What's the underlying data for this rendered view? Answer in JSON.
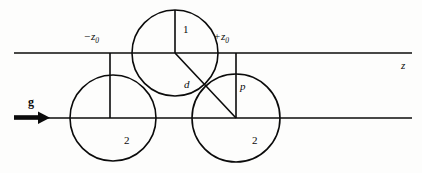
{
  "figure": {
    "background_color": "#fdfdfc",
    "ink_color": "#0b0b0b",
    "width": 422,
    "height": 173,
    "labels": {
      "left_bound_sign": "−",
      "left_bound_var": "z",
      "left_bound_sub": "0",
      "right_bound_sign": "+",
      "right_bound_var": "z",
      "right_bound_sub": "0",
      "axis": "z",
      "gravity": "g",
      "sphere_top": "1",
      "sphere_bottom_left": "2",
      "sphere_bottom_right": "2",
      "distance": "d",
      "point": "p"
    },
    "geometry": {
      "top_line": {
        "x1": 14,
        "y1": 53,
        "x2": 412,
        "y2": 53
      },
      "bottom_line": {
        "x1": 14,
        "y1": 118,
        "x2": 412,
        "y2": 118
      },
      "gravity_arrow": {
        "x1": 14,
        "y1": 118,
        "x2": 48,
        "y2": 118
      },
      "circle_top": {
        "cx": 175,
        "cy": 53,
        "r": 43
      },
      "circle_bottom_left": {
        "cx": 113,
        "cy": 118,
        "r": 43
      },
      "circle_bottom_right": {
        "cx": 236,
        "cy": 118,
        "r": 44
      },
      "vertical_radius_top": {
        "x1": 175,
        "y1": 10,
        "x2": 175,
        "y2": 53
      },
      "vertical_left_tick": {
        "x1": 110,
        "y1": 53,
        "x2": 110,
        "y2": 118
      },
      "vertical_right_tick": {
        "x1": 236,
        "y1": 53,
        "x2": 236,
        "y2": 118
      },
      "diagonal_center_line": {
        "x1": 175,
        "y1": 53,
        "x2": 236,
        "y2": 118
      }
    }
  }
}
